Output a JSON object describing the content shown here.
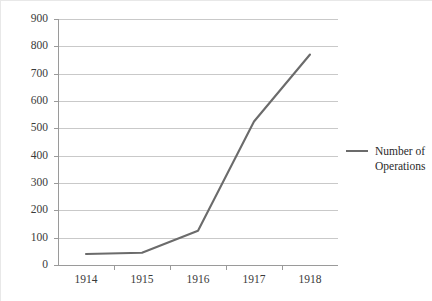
{
  "chart_data": {
    "type": "line",
    "title": "",
    "xlabel": "",
    "ylabel": "",
    "categories": [
      "1914",
      "1915",
      "1916",
      "1917",
      "1918"
    ],
    "series": [
      {
        "name": "Number of Operations",
        "values": [
          40,
          45,
          125,
          525,
          770
        ],
        "color": "#6b6b6b"
      }
    ],
    "ylim": [
      0,
      900
    ],
    "ytick_step": 100,
    "yticks": [
      0,
      100,
      200,
      300,
      400,
      500,
      600,
      700,
      800,
      900
    ],
    "ytick_labels": [
      "0",
      "100",
      "200",
      "300",
      "400",
      "500",
      "600",
      "700",
      "800",
      "900"
    ],
    "grid": true,
    "grid_axis": "y",
    "legend": {
      "position": "right",
      "entries": [
        "Number of Operations"
      ]
    }
  },
  "legend": {
    "label_line1": "Number of",
    "label_line2": "Operations"
  },
  "colors": {
    "series_line": "#6b6b6b",
    "gridline": "#c9c9c9",
    "axis": "#9a9a9a",
    "text": "#3a3a3a",
    "background": "#ffffff"
  }
}
